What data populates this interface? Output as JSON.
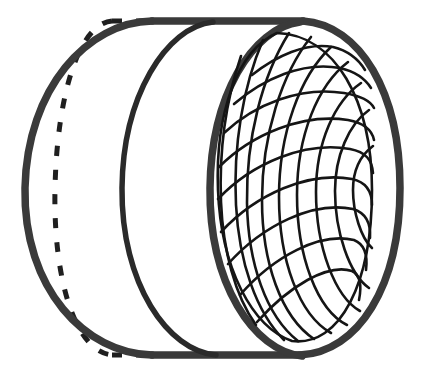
{
  "figure": {
    "title": "Sphere inscribed in a cylinder",
    "background_color": "#ffffff",
    "ink_color": "#2e2e2e",
    "mesh_color": "#1a1a1a",
    "canvas": {
      "width": 424,
      "height": 374
    },
    "parts": [
      {
        "name": "cylinder-silhouette",
        "label": "Cylinder outline",
        "stroke_color": "#3a3a3a",
        "stroke_width": 7,
        "dashed": false
      },
      {
        "name": "back-rim-dashed-ellipse",
        "label": "Hidden back rim (dashed)",
        "stroke_color": "#1f1f1f",
        "stroke_width": 5,
        "dashed": true,
        "dash_pattern": "9 13",
        "center": {
          "cx": 110,
          "cy": 188
        },
        "radii": {
          "rx": 58,
          "ry": 169
        }
      },
      {
        "name": "middle-rim-ellipse",
        "label": "Middle rim ellipse",
        "stroke_color": "#2a2a2a",
        "stroke_width": 5,
        "dashed": false,
        "center": {
          "cx": 182,
          "cy": 188
        },
        "radii": {
          "rx": 60,
          "ry": 170
        }
      },
      {
        "name": "front-rim-ellipse",
        "label": "Front rim ellipse",
        "stroke_color": "#3a3a3a",
        "stroke_width": 7,
        "dashed": false,
        "center": {
          "cx": 272,
          "cy": 188
        },
        "radii": {
          "rx": 62,
          "ry": 167
        }
      },
      {
        "name": "sphere-wireframe",
        "label": "Inscribed sphere wireframe",
        "stroke_color": "#151515",
        "stroke_width": 2.6,
        "dashed": false,
        "center": {
          "cx": 283,
          "cy": 188
        },
        "radii": {
          "rx": 75,
          "ry": 155
        },
        "family_a_count": 9,
        "family_b_count": 9,
        "tilt_degrees": 38
      }
    ],
    "geometry": {
      "silhouette_left_x": 25,
      "silhouette_right_x": 400,
      "silhouette_top_y": 21,
      "silhouette_bottom_y": 355,
      "axis_y": 188,
      "end_cap_rx": 62
    }
  }
}
